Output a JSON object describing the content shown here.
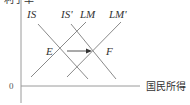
{
  "diagram": {
    "axes": {
      "origin_label": "0",
      "x_label": "国民所得",
      "y_label": "利子率"
    },
    "curves": [
      {
        "id": "IS",
        "label": "IS"
      },
      {
        "id": "IS_prime",
        "label": "IS'"
      },
      {
        "id": "LM",
        "label": "LM"
      },
      {
        "id": "LM_prime",
        "label": "LM'"
      }
    ],
    "points": [
      {
        "id": "E",
        "label": "E"
      },
      {
        "id": "F",
        "label": "F"
      }
    ],
    "arrow": {
      "from": "E",
      "to": "F",
      "direction": "right"
    },
    "colors": {
      "line": "#8a8a8a",
      "axis": "#9a9a9a",
      "text": "#333333"
    }
  }
}
